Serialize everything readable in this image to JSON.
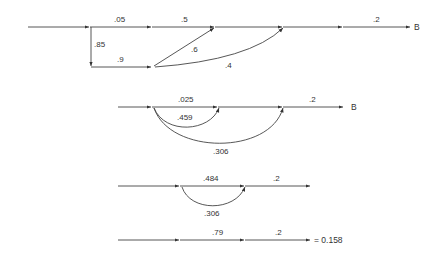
{
  "diagrams": [
    {
      "id": "signal-flow-1",
      "terminal": "B",
      "edges": [
        {
          "from": "n0",
          "to": "n1",
          "gain": ".05"
        },
        {
          "from": "n1",
          "to": "n2",
          "gain": ".5"
        },
        {
          "from": "n0",
          "to": "n4",
          "gain": ".85"
        },
        {
          "from": "n4",
          "to": "n5",
          "gain": ".9"
        },
        {
          "from": "n5",
          "to": "n2",
          "gain": ".6"
        },
        {
          "from": "n5",
          "to": "n3",
          "gain": ".4"
        },
        {
          "from": "n3",
          "to": "B",
          "gain": ".2"
        }
      ],
      "labels": {
        "g05": ".05",
        "g5": ".5",
        "g85": ".85",
        "g9": ".9",
        "g6": ".6",
        "g4": ".4",
        "g2": ".2",
        "terminal": "B"
      }
    },
    {
      "id": "signal-flow-2",
      "terminal": "B",
      "labels": {
        "g025": ".025",
        "g459": ".459",
        "g306": ".306",
        "g2": ".2",
        "terminal": "B"
      }
    },
    {
      "id": "signal-flow-3",
      "labels": {
        "g484": ".484",
        "g306": ".306",
        "g2": ".2"
      }
    },
    {
      "id": "signal-flow-4",
      "labels": {
        "g79": ".79",
        "g2": ".2",
        "result": "= 0.158"
      }
    }
  ],
  "colors": {
    "line": "#333333",
    "background": "#ffffff"
  }
}
